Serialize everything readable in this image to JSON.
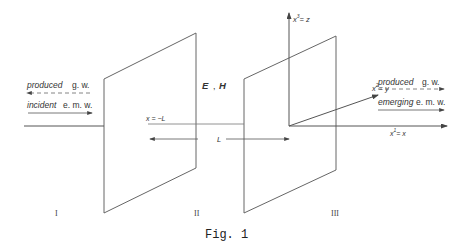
{
  "figure": {
    "caption": "Fig. 1",
    "regions": [
      "I",
      "II",
      "III"
    ],
    "fields_label": {
      "e": "E",
      "sep": ",",
      "h": "H"
    },
    "left_arrows": {
      "produced": {
        "word": "produced",
        "abbr": "g. w."
      },
      "incident": {
        "word": "incident",
        "abbr": "e. m. w."
      }
    },
    "right_arrows": {
      "produced": {
        "word": "produced",
        "abbr": "g. w."
      },
      "emerging": {
        "word": "emerging",
        "abbr": "e. m. w."
      }
    },
    "boundary_label": "x = −L",
    "distance_label": "L",
    "axes": {
      "x": {
        "label": "x",
        "sup": "1",
        "eq": "= x"
      },
      "y": {
        "label": "x",
        "sup": "2",
        "eq": "= y"
      },
      "z": {
        "label": "x",
        "sup": "3",
        "eq": "= z"
      }
    },
    "colors": {
      "line": "#555555",
      "background": "#ffffff"
    }
  }
}
